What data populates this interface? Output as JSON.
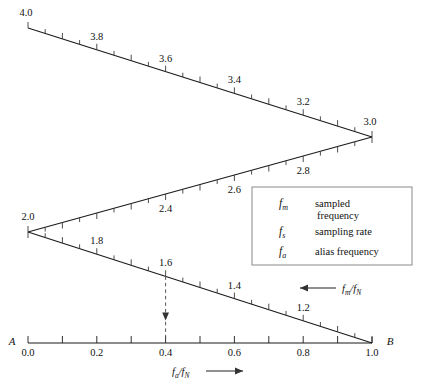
{
  "chart_data": {
    "type": "line",
    "title": "",
    "xlabel": "fa/fN",
    "ylabel": "fm/fN",
    "xlim": [
      0.0,
      1.0
    ],
    "grid": false,
    "x_axis": {
      "endpoint_left_label": "A",
      "endpoint_right_label": "B",
      "label": "fa/fN",
      "arrow": "right",
      "tick_values": [
        0.0,
        0.1,
        0.2,
        0.3,
        0.4,
        0.5,
        0.6,
        0.7,
        0.8,
        0.9,
        1.0
      ],
      "tick_labels": [
        "0.0",
        "",
        "0.2",
        "",
        "0.4",
        "",
        "0.6",
        "",
        "0.8",
        "",
        "1.0"
      ]
    },
    "fold_label": {
      "text": "fm/fN",
      "arrow": "left"
    },
    "segments": [
      {
        "name": "segment-4-to-3",
        "direction": "descending",
        "from": {
          "x": 0.0,
          "fm": 4.0
        },
        "to": {
          "x": 1.0,
          "fm": 3.0
        },
        "tick_side": "up",
        "labels": [
          {
            "x": 0.0,
            "text": "4.0"
          },
          {
            "x": 0.2,
            "text": "3.8"
          },
          {
            "x": 0.4,
            "text": "3.6"
          },
          {
            "x": 0.6,
            "text": "3.4"
          },
          {
            "x": 0.8,
            "text": "3.2"
          },
          {
            "x": 1.0,
            "text": "3.0"
          }
        ],
        "minor_ticks": [
          0.1,
          0.3,
          0.5,
          0.7,
          0.9
        ]
      },
      {
        "name": "segment-2-to-3",
        "direction": "ascending",
        "from": {
          "x": 0.0,
          "fm": 2.0
        },
        "to": {
          "x": 1.0,
          "fm": 3.0
        },
        "tick_side": "down",
        "labels": [
          {
            "x": 0.4,
            "text": "2.4"
          },
          {
            "x": 0.6,
            "text": "2.6"
          },
          {
            "x": 0.8,
            "text": "2.8"
          }
        ],
        "minor_ticks": [
          0.1,
          0.3,
          0.5,
          0.7,
          0.9
        ]
      },
      {
        "name": "segment-2-to-1",
        "direction": "descending",
        "from": {
          "x": 0.0,
          "fm": 2.0
        },
        "to": {
          "x": 1.0,
          "fm": 1.0
        },
        "tick_side": "up",
        "labels": [
          {
            "x": 0.0,
            "text": "2.0"
          },
          {
            "x": 0.2,
            "text": "1.8"
          },
          {
            "x": 0.4,
            "text": "1.6"
          },
          {
            "x": 0.6,
            "text": "1.4"
          },
          {
            "x": 0.8,
            "text": "1.2"
          }
        ],
        "minor_ticks": [
          0.1,
          0.3,
          0.5,
          0.7,
          0.9
        ]
      }
    ],
    "marker": {
      "name": "alias-trace",
      "x": 0.4,
      "fm": 1.6,
      "style": "dashed-vertical-with-down-arrow"
    },
    "legend": {
      "entries": [
        {
          "symbol": "f",
          "subscript": "m",
          "text": "sampled frequency"
        },
        {
          "symbol": "f",
          "subscript": "s",
          "text": "sampling rate"
        },
        {
          "symbol": "f",
          "subscript": "a",
          "text": "alias frequency"
        }
      ]
    }
  }
}
